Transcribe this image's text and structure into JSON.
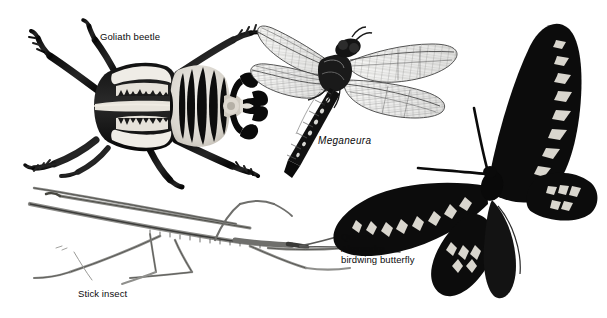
{
  "plate": {
    "width": 607,
    "height": 318,
    "background_color": "#ffffff",
    "ink_color": "#111111",
    "type": "scientific illustration plate of large insects"
  },
  "labels": [
    {
      "id": "goliath-beetle",
      "text": "Goliath beetle",
      "style": "roman",
      "x": 100,
      "y": 31
    },
    {
      "id": "meganeura",
      "text": "Meganeura",
      "style": "italic",
      "x": 318,
      "y": 135
    },
    {
      "id": "stick-insect",
      "text": "Stick insect",
      "style": "roman",
      "x": 78,
      "y": 288
    }
  ],
  "butterfly_label": {
    "id": "queen-alexandra-birdwing-butterfly",
    "lines": [
      "Queen",
      "Alexandra",
      "birdwing butterfly"
    ],
    "line1": "Queen",
    "line2": "Alexandra",
    "line3": "birdwing butterfly",
    "x": 341,
    "y": 231
  },
  "specimens": [
    {
      "id": "goliath-beetle",
      "common_name": "Goliath beetle",
      "label_text": "Goliath beetle",
      "position": "top-left",
      "rendering": "black-and-white photographic halftone",
      "orientation": "head to the right",
      "features": "striped black and white elytra, six thick spurred legs, clubbed lamellate antennae"
    },
    {
      "id": "meganeura",
      "common_name": "Meganeura",
      "label_text": "Meganeura",
      "position": "top-right",
      "rendering": "fine line engraving",
      "orientation": "abdomen pointing down-left",
      "features": "four long translucent veined wings, dark segmented abdomen with pale spots"
    },
    {
      "id": "stick-insect",
      "common_name": "Stick insect",
      "label_text": "Stick insect",
      "position": "bottom-left",
      "rendering": "pale line drawing",
      "orientation": "head to the right",
      "features": "extremely slender elongated body with long thin splayed legs and antennae"
    },
    {
      "id": "queen-alexandra-birdwing-butterfly",
      "common_name": "Queen Alexandra birdwing butterfly",
      "label_text": "Queen Alexandra birdwing butterfly",
      "position": "right",
      "rendering": "black silhouette photograph",
      "orientation": "wings spread, antennae to the upper left",
      "features": "black wings with rows of white arrowhead spots along the margins"
    }
  ]
}
